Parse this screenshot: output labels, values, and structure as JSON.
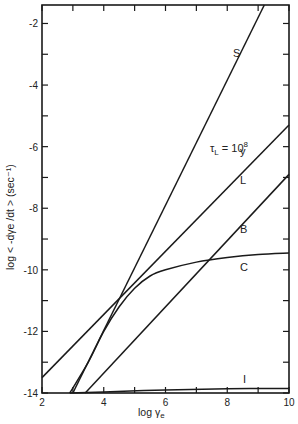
{
  "chart_data": {
    "type": "line",
    "title": "",
    "xlabel": "log γe",
    "ylabel": "log < -dγe /dt > (sec⁻¹)",
    "xlim": [
      2,
      10
    ],
    "ylim": [
      -14,
      -1.4
    ],
    "xticks": [
      2,
      4,
      6,
      8,
      10
    ],
    "xtick_labels": [
      "2",
      "4",
      "6",
      "8",
      "10"
    ],
    "yticks": [
      -2,
      -4,
      -6,
      -8,
      -10,
      -12,
      -14
    ],
    "ytick_labels": [
      "-2",
      "-4",
      "-6",
      "-8",
      "-10",
      "-12",
      "-14"
    ],
    "grid": false,
    "legend": "inline curve labels",
    "annotation": "τL = 10⁸ y",
    "series": [
      {
        "name": "S",
        "x": [
          3.0,
          9.2
        ],
        "y": [
          -14.0,
          -1.4
        ]
      },
      {
        "name": "L",
        "x": [
          2.0,
          10.0
        ],
        "y": [
          -13.5,
          -5.3
        ]
      },
      {
        "name": "B",
        "x": [
          3.4,
          10.0
        ],
        "y": [
          -14.0,
          -6.9
        ]
      },
      {
        "name": "C",
        "x": [
          2.9,
          3.5,
          4.0,
          4.5,
          5.0,
          5.5,
          6.0,
          7.0,
          8.0,
          9.0,
          10.0
        ],
        "y": [
          -14.0,
          -13.0,
          -12.0,
          -11.2,
          -10.6,
          -10.2,
          -10.0,
          -9.75,
          -9.6,
          -9.5,
          -9.45
        ]
      },
      {
        "name": "I",
        "x": [
          2.9,
          4.0,
          6.0,
          8.0,
          10.0
        ],
        "y": [
          -14.0,
          -13.97,
          -13.9,
          -13.86,
          -13.85
        ]
      }
    ]
  },
  "labels": {
    "S": "S",
    "L": "L",
    "B": "B",
    "C": "C",
    "I": "I",
    "tau_main": "τ",
    "tau_sub": "L",
    "tau_eq": " = 10",
    "tau_exp": "8",
    "tau_unit": "y",
    "xlabel_main": "log γ",
    "xlabel_sub": "e",
    "ylabel": "log < -dγe /dt > (sec⁻¹)"
  }
}
